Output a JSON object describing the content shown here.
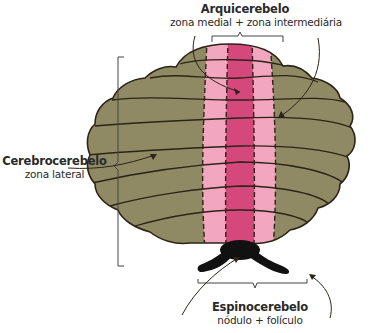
{
  "diagram": {
    "subject": "cerebelo",
    "colors": {
      "lateral_zone": "#8f8a64",
      "intermediate_zone": "#f2a6bf",
      "medial_zone": "#d4487b",
      "flocculonodular": "#111111",
      "outline": "#2b2418",
      "bracket": "#444444"
    },
    "labels": {
      "arquicerebelo": {
        "title": "Arquicerebelo",
        "subtitle": "zona medial + zona intermediária"
      },
      "cerebrocerebelo": {
        "title": "Cerebrocerebelo",
        "subtitle": "zona lateral"
      },
      "espinocerebelo": {
        "title": "Espinocerebelo",
        "subtitle": "nódulo + folículo"
      }
    }
  }
}
